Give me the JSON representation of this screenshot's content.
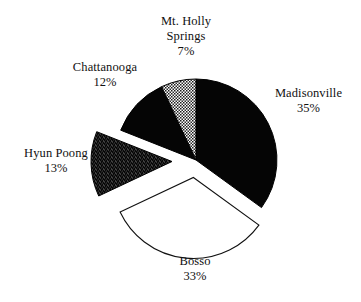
{
  "chart_data": {
    "type": "pie",
    "title": "",
    "subtitle": "",
    "xlabel": "",
    "ylabel": "",
    "legend_position": "none",
    "grid": false,
    "labels_show_percent": true,
    "categories": [
      "Madisonville",
      "Bosso",
      "Hyun Poong",
      "Chattanooga",
      "Mt. Holly Springs"
    ],
    "values": [
      35,
      33,
      13,
      12,
      7
    ],
    "units": "%",
    "slices": [
      {
        "name": "Madisonville",
        "label": "Madisonville",
        "value": 35,
        "percent_label": "35%",
        "fill": "#050505",
        "fill_style": "solid-black",
        "exploded": false,
        "stroke": "#000000"
      },
      {
        "name": "Bosso",
        "label": "Bosso",
        "value": 33,
        "percent_label": "33%",
        "fill": "#ffffff",
        "fill_style": "white-outline",
        "exploded": true,
        "stroke": "#000000"
      },
      {
        "name": "Hyun Poong",
        "label": "Hyun Poong",
        "value": 13,
        "percent_label": "13%",
        "fill": "#121212",
        "fill_style": "dark-stipple",
        "exploded": true,
        "stroke": "#000000"
      },
      {
        "name": "Chattanooga",
        "label": "Chattanooga",
        "value": 12,
        "percent_label": "12%",
        "fill": "#050505",
        "fill_style": "solid-black",
        "exploded": false,
        "stroke": "#000000"
      },
      {
        "name": "Mt. Holly Springs",
        "label_line1": "Mt. Holly",
        "label_line2": "Springs",
        "label": "Mt. Holly Springs",
        "value": 7,
        "percent_label": "7%",
        "fill": "#8a8a8a",
        "fill_style": "gray-stipple",
        "exploded": false,
        "stroke": "#000000"
      }
    ],
    "background": "#ffffff",
    "text_color": "#111111"
  }
}
